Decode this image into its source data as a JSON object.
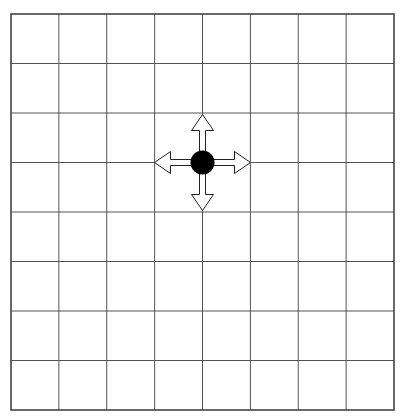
{
  "board": {
    "rows": 8,
    "cols": 8,
    "left": 11,
    "top": 14,
    "right": 394,
    "bottom": 410,
    "line_color": "#555555",
    "border_color": "#444444"
  },
  "piece": {
    "type": "filled-circle",
    "col_line": 4,
    "row_line": 3,
    "color": "#000000",
    "radius": 12
  },
  "move_arrows": [
    {
      "direction": "up"
    },
    {
      "direction": "down"
    },
    {
      "direction": "left"
    },
    {
      "direction": "right"
    }
  ]
}
